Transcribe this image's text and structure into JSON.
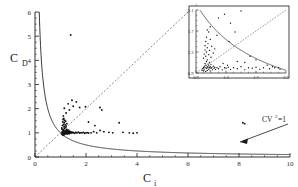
{
  "chart_data": {
    "type": "scatter",
    "title": "",
    "xlabel": "C_i",
    "ylabel": "C_D",
    "xlim": [
      0,
      10
    ],
    "ylim": [
      0,
      6
    ],
    "xticks": [
      0,
      2,
      4,
      6,
      8,
      10
    ],
    "yticks": [
      0,
      1,
      2,
      3,
      4,
      5,
      6
    ],
    "xtick_labels": [
      "0",
      "2",
      "4",
      "6",
      "8",
      "10"
    ],
    "ytick_labels": [
      "0",
      "1",
      "2",
      "3",
      "4",
      "5",
      "6"
    ],
    "grid": false,
    "legend": "none",
    "annotations": [
      {
        "text": "CV",
        "superscript": "2",
        "suffix": "=1",
        "x": 8.9,
        "y": 1.75,
        "arrow_to_x": 8.0,
        "arrow_to_y": 0.62
      }
    ],
    "curves": [
      {
        "name": "cv2-equals-1-hyperbola",
        "style": "solid",
        "equation": "C_D = 1 / C_i",
        "color": "#222222"
      },
      {
        "name": "identity-line",
        "style": "dashed",
        "equation": "C_D = C_i",
        "color": "#555555"
      }
    ],
    "points": [
      [
        1.05,
        0.95
      ],
      [
        1.06,
        1.0
      ],
      [
        1.07,
        1.05
      ],
      [
        1.08,
        0.92
      ],
      [
        1.09,
        1.02
      ],
      [
        1.1,
        0.98
      ],
      [
        1.1,
        1.08
      ],
      [
        1.11,
        1.0
      ],
      [
        1.12,
        1.12
      ],
      [
        1.12,
        0.9
      ],
      [
        1.13,
        1.04
      ],
      [
        1.14,
        0.96
      ],
      [
        1.15,
        1.0
      ],
      [
        1.15,
        1.18
      ],
      [
        1.16,
        1.06
      ],
      [
        1.17,
        0.94
      ],
      [
        1.18,
        1.02
      ],
      [
        1.19,
        1.1
      ],
      [
        1.2,
        0.99
      ],
      [
        1.2,
        1.22
      ],
      [
        1.21,
        1.03
      ],
      [
        1.22,
        0.97
      ],
      [
        1.23,
        1.08
      ],
      [
        1.24,
        1.01
      ],
      [
        1.25,
        1.14
      ],
      [
        1.26,
        0.95
      ],
      [
        1.27,
        1.05
      ],
      [
        1.28,
        1.0
      ],
      [
        1.29,
        1.09
      ],
      [
        1.3,
        0.98
      ],
      [
        1.31,
        1.04
      ],
      [
        1.32,
        1.11
      ],
      [
        1.33,
        1.0
      ],
      [
        1.34,
        0.96
      ],
      [
        1.35,
        1.06
      ],
      [
        1.36,
        1.02
      ],
      [
        1.38,
        1.0
      ],
      [
        1.4,
        1.05
      ],
      [
        1.42,
        0.99
      ],
      [
        1.45,
        1.03
      ],
      [
        1.48,
        1.0
      ],
      [
        1.5,
        1.02
      ],
      [
        1.55,
        0.98
      ],
      [
        1.6,
        1.01
      ],
      [
        1.65,
        1.0
      ],
      [
        1.7,
        1.03
      ],
      [
        1.75,
        0.99
      ],
      [
        1.8,
        1.01
      ],
      [
        1.85,
        1.0
      ],
      [
        1.9,
        1.02
      ],
      [
        1.95,
        0.98
      ],
      [
        2.0,
        1.0
      ],
      [
        2.05,
        1.01
      ],
      [
        2.1,
        0.99
      ],
      [
        2.2,
        1.0
      ],
      [
        1.08,
        1.3
      ],
      [
        1.09,
        1.45
      ],
      [
        1.1,
        1.55
      ],
      [
        1.11,
        1.7
      ],
      [
        1.12,
        1.35
      ],
      [
        1.13,
        1.6
      ],
      [
        1.14,
        1.25
      ],
      [
        1.15,
        1.42
      ],
      [
        1.16,
        1.52
      ],
      [
        1.18,
        1.33
      ],
      [
        1.2,
        1.48
      ],
      [
        1.22,
        1.28
      ],
      [
        1.25,
        1.38
      ],
      [
        1.05,
        1.2
      ],
      [
        1.06,
        1.15
      ],
      [
        1.15,
        2.02
      ],
      [
        1.35,
        1.95
      ],
      [
        1.3,
        2.2
      ],
      [
        1.45,
        2.35
      ],
      [
        1.22,
        1.82
      ],
      [
        1.5,
        2.1
      ],
      [
        1.62,
        2.28
      ],
      [
        1.75,
        2.05
      ],
      [
        2.55,
        2.05
      ],
      [
        2.62,
        1.95
      ],
      [
        2.1,
        1.45
      ],
      [
        2.35,
        1.3
      ],
      [
        2.55,
        1.1
      ],
      [
        2.7,
        1.05
      ],
      [
        2.9,
        1.02
      ],
      [
        3.05,
        1.0
      ],
      [
        3.3,
        1.42
      ],
      [
        3.45,
        1.02
      ],
      [
        3.7,
        1.0
      ],
      [
        3.85,
        0.98
      ],
      [
        4.0,
        1.0
      ],
      [
        1.4,
        5.05
      ],
      [
        8.15,
        1.42
      ],
      [
        8.22,
        1.38
      ],
      [
        2.3,
        1.05
      ],
      [
        2.42,
        1.0
      ],
      [
        1.98,
        2.08
      ],
      [
        1.6,
        1.02
      ]
    ],
    "inset": {
      "xlim": [
        0.9,
        2.1
      ],
      "ylim": [
        0.9,
        2.1
      ],
      "xticks": [
        0.9,
        1.3,
        1.7,
        2.1
      ],
      "yticks": [
        0.9,
        1.3,
        1.7,
        2.1
      ],
      "xtick_labels": [
        "0.9",
        "1.3",
        "1.7",
        "2.1"
      ],
      "ytick_labels": [
        "0.9",
        "1.3",
        "1.7",
        "2.1"
      ],
      "curves": [
        {
          "name": "cv2-equals-1-hyperbola",
          "style": "solid",
          "equation": "C_D = 1 / C_i"
        },
        {
          "name": "identity-line",
          "style": "dashed",
          "equation": "C_D = C_i"
        }
      ],
      "points": [
        [
          0.98,
          0.95
        ],
        [
          0.99,
          0.98
        ],
        [
          1.0,
          1.0
        ],
        [
          1.0,
          0.94
        ],
        [
          1.01,
          1.03
        ],
        [
          1.01,
          0.96
        ],
        [
          1.02,
          1.0
        ],
        [
          1.02,
          1.08
        ],
        [
          1.03,
          0.93
        ],
        [
          1.03,
          1.05
        ],
        [
          1.04,
          0.99
        ],
        [
          1.04,
          1.12
        ],
        [
          1.05,
          1.02
        ],
        [
          1.05,
          0.95
        ],
        [
          1.06,
          1.0
        ],
        [
          1.06,
          1.07
        ],
        [
          1.07,
          0.97
        ],
        [
          1.07,
          1.04
        ],
        [
          1.08,
          1.0
        ],
        [
          1.08,
          1.1
        ],
        [
          1.09,
          0.94
        ],
        [
          1.09,
          1.02
        ],
        [
          1.1,
          0.99
        ],
        [
          1.1,
          1.06
        ],
        [
          1.11,
          1.0
        ],
        [
          1.12,
          0.96
        ],
        [
          1.13,
          1.03
        ],
        [
          1.14,
          0.99
        ],
        [
          1.15,
          1.01
        ],
        [
          1.16,
          0.97
        ],
        [
          1.18,
          1.0
        ],
        [
          1.2,
          0.98
        ],
        [
          1.22,
          1.02
        ],
        [
          1.25,
          0.96
        ],
        [
          1.28,
          1.0
        ],
        [
          1.3,
          0.99
        ],
        [
          1.33,
          1.01
        ],
        [
          1.36,
          0.97
        ],
        [
          1.4,
          1.0
        ],
        [
          1.45,
          0.98
        ],
        [
          1.5,
          1.02
        ],
        [
          1.55,
          0.96
        ],
        [
          1.6,
          1.0
        ],
        [
          1.65,
          0.99
        ],
        [
          1.7,
          1.01
        ],
        [
          1.75,
          0.97
        ],
        [
          1.8,
          1.0
        ],
        [
          1.88,
          0.98
        ],
        [
          1.95,
          1.0
        ],
        [
          2.02,
          0.97
        ],
        [
          1.0,
          1.18
        ],
        [
          1.01,
          1.26
        ],
        [
          1.02,
          1.34
        ],
        [
          1.02,
          1.42
        ],
        [
          1.03,
          1.22
        ],
        [
          1.03,
          1.5
        ],
        [
          1.04,
          1.3
        ],
        [
          1.04,
          1.58
        ],
        [
          1.05,
          1.38
        ],
        [
          1.05,
          1.15
        ],
        [
          1.06,
          1.46
        ],
        [
          1.07,
          1.25
        ],
        [
          1.08,
          1.33
        ],
        [
          1.09,
          1.54
        ],
        [
          1.1,
          1.2
        ],
        [
          1.11,
          1.41
        ],
        [
          1.13,
          1.28
        ],
        [
          1.15,
          1.36
        ],
        [
          1.18,
          1.62
        ],
        [
          1.05,
          1.72
        ],
        [
          1.09,
          1.78
        ],
        [
          1.28,
          2.02
        ],
        [
          1.5,
          2.08
        ],
        [
          1.36,
          1.85
        ],
        [
          1.2,
          1.95
        ],
        [
          1.42,
          1.68
        ],
        [
          1.62,
          1.22
        ],
        [
          1.7,
          1.15
        ],
        [
          1.55,
          1.1
        ],
        [
          1.45,
          1.12
        ],
        [
          1.26,
          1.08
        ],
        [
          1.32,
          1.05
        ],
        [
          1.85,
          1.05
        ],
        [
          1.92,
          1.02
        ],
        [
          2.0,
          1.0
        ],
        [
          1.34,
          1.5
        ],
        [
          1.07,
          1.68
        ]
      ]
    }
  }
}
